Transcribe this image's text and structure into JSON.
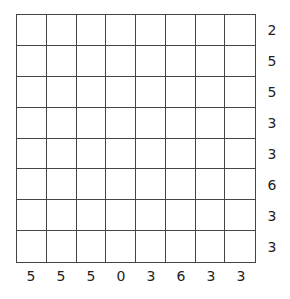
{
  "puzzle": {
    "rows": 8,
    "cols": 8,
    "row_clues": [
      "2",
      "5",
      "5",
      "3",
      "3",
      "6",
      "3",
      "3"
    ],
    "col_clues": [
      "5",
      "5",
      "5",
      "0",
      "3",
      "6",
      "3",
      "3"
    ]
  }
}
